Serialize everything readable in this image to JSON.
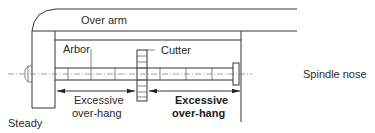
{
  "diagram": {
    "labels": {
      "over_arm": "Over arm",
      "arbor": "Arbor",
      "cutter": "Cutter",
      "spindle_nose": "Spindle nose",
      "steady": "Steady",
      "overhang_left_line1": "Excessive",
      "overhang_left_line2": "over-hang",
      "overhang_right_line1": "Excessive",
      "overhang_right_line2": "over-hang"
    },
    "colors": {
      "line": "#333333",
      "text": "#2a2a2a",
      "background": "#ffffff"
    }
  }
}
